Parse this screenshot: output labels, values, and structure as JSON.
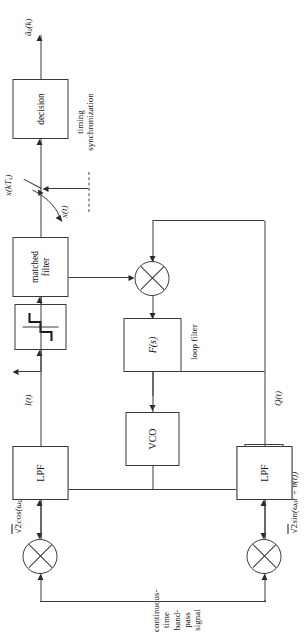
{
  "figure": {
    "orientation": "rotated-90-ccw",
    "background": "#ffffff",
    "line_color": "#3a3a3a"
  },
  "blocks": {
    "decision": "decision",
    "matched_filter_line1": "matched",
    "matched_filter_line2": "filter",
    "slicer": "sign-nonlinearity-staircase",
    "lpf_i": "LPF",
    "lpf_q": "LPF",
    "loop_filter_tf": "F(s)",
    "vco": "VCO",
    "phase_shift_line1": "π/2",
    "phase_shift_line2": "shift"
  },
  "labels": {
    "output_decision": "â₀(k)",
    "sample_values": "x(kTₛ)",
    "mf_output": "x(t)",
    "timing_sync_line1": "timing",
    "timing_sync_line2": "synchronization",
    "inphase": "I(t)",
    "quadrature": "Q(t)",
    "loop_filter_caption": "loop filter",
    "carrier_cos": "√2 cos(ω₀t + θ̂(t))",
    "carrier_sin": "√2 sin(ω₀t + θ̂(t))",
    "input_line1": "continuous-time",
    "input_line2": "band-pass signal"
  },
  "math": {
    "carrier_cos_parts": {
      "radical": "√2",
      "fn": "cos(",
      "omega": "ω",
      "omega_sub": "0",
      "t": "t + ",
      "theta": "θ̂(t))"
    },
    "carrier_sin_parts": {
      "radical": "√2",
      "fn": "sin(",
      "omega": "ω",
      "omega_sub": "0",
      "t": "t + ",
      "theta": "θ̂(t))"
    },
    "output_parts": {
      "a": "â",
      "a_sub": "0",
      "k": "(k)"
    },
    "sample_parts": {
      "x": "x(kT",
      "x_sub": "s",
      "close": ")"
    }
  },
  "nodes": {
    "multiplier_symbol": "⊗",
    "switch_symbol": "sampler-switch"
  }
}
